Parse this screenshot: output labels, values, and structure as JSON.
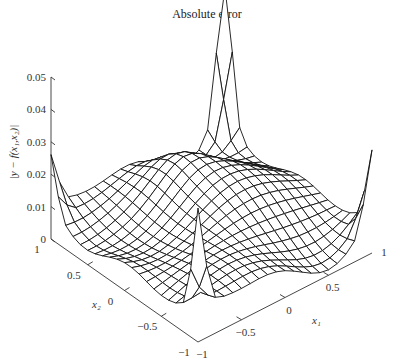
{
  "chart_data": {
    "type": "surface",
    "title": "Absolute error",
    "zlabel": "|y − f(x₁,x₂)|",
    "xlabel": "x₁",
    "ylabel": "x₂",
    "x1_ticks": [
      "−1",
      "−0.5",
      "0",
      "0.5",
      "1"
    ],
    "x2_ticks": [
      "−1",
      "−0.5",
      "0",
      "0.5",
      "1"
    ],
    "z_ticks": [
      "0",
      "0.01",
      "0.02",
      "0.03",
      "0.04",
      "0.05"
    ],
    "xlim": [
      -1,
      1
    ],
    "ylim": [
      -1,
      1
    ],
    "zlim": [
      0,
      0.05
    ],
    "grid": false,
    "style": "wireframe mesh, black lines on white",
    "features": [
      {
        "location": "x1=1, x2=1 (back corner)",
        "z": 0.05,
        "note": "sharp peak"
      },
      {
        "location": "x1=-1, x2=-1 (front corner)",
        "z": 0.035,
        "note": "sharp spike"
      },
      {
        "location": "x1=1, x2=-1 (right corner)",
        "z": 0.025,
        "note": "spike"
      },
      {
        "location": "x1=-1, x2=1 (left corner)",
        "z": 0.02,
        "note": "spike"
      },
      {
        "location": "interior",
        "z": 0.01,
        "note": "oscillating ridges ~0.005–0.015"
      }
    ]
  },
  "labels": {
    "title": "Absolute error",
    "zlabel": "|y − f(x₁,x₂)|",
    "x1": "x₁",
    "x2": "x₂"
  }
}
